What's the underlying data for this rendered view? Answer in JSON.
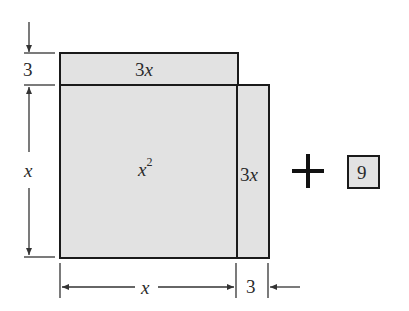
{
  "diagram": {
    "colors": {
      "fill": "#e2e2e2",
      "stroke": "#1a1a1a",
      "dimension": "#333333"
    },
    "regions": {
      "top_strip": {
        "label_coef": "3",
        "label_var": "x"
      },
      "square": {
        "label_var": "x",
        "label_exp": "2"
      },
      "right_strip": {
        "label_coef": "3",
        "label_var": "x"
      },
      "unit_square": {
        "label": "9"
      }
    },
    "operator": "+",
    "dimensions": {
      "left_top": "3",
      "left_main": "x",
      "bottom_main": "x",
      "bottom_right": "3"
    }
  }
}
